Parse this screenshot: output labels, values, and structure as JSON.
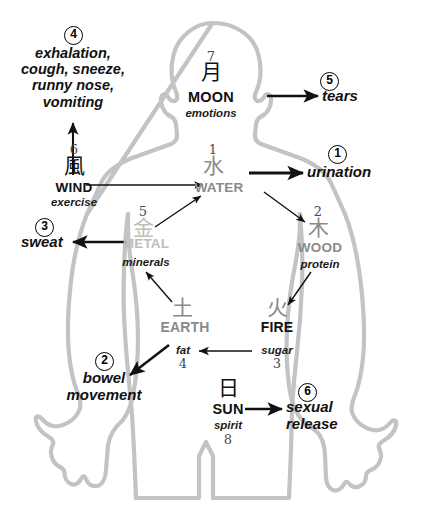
{
  "colors": {
    "body_outline": "#c3c3c3",
    "element_gray": "#8a8a8a",
    "metal_gray": "#bdbdbd",
    "arrow_black": "#111111",
    "text_black": "#111111",
    "number_gray": "#4a4a4a",
    "background": "#ffffff"
  },
  "elements": [
    {
      "key": "water",
      "number": "1",
      "kanji": "水",
      "name": "WATER",
      "subtitle": "",
      "color": "#8a8a8a"
    },
    {
      "key": "wood",
      "number": "2",
      "kanji": "木",
      "name": "WOOD",
      "subtitle": "protein",
      "color": "#8a8a8a"
    },
    {
      "key": "fire",
      "number": "3",
      "kanji": "火",
      "name": "FIRE",
      "subtitle": "sugar",
      "color": "#8a8a8a"
    },
    {
      "key": "earth",
      "number": "4",
      "kanji": "土",
      "name": "EARTH",
      "subtitle": "fat",
      "color": "#8a8a8a"
    },
    {
      "key": "metal",
      "number": "5",
      "kanji": "金",
      "name": "METAL",
      "subtitle": "minerals",
      "color": "#bdbdbd"
    },
    {
      "key": "wind",
      "number": "6",
      "kanji": "風",
      "name": "WIND",
      "subtitle": "exercise",
      "color": "#111111"
    },
    {
      "key": "moon",
      "number": "7",
      "kanji": "月",
      "name": "MOON",
      "subtitle": "emotions",
      "color": "#111111"
    },
    {
      "key": "sun",
      "number": "8",
      "kanji": "日",
      "name": "SUN",
      "subtitle": "spirit",
      "color": "#111111"
    }
  ],
  "outputs": [
    {
      "key": "urination",
      "marker": "1",
      "label": "urination"
    },
    {
      "key": "bowel_movement",
      "marker": "2",
      "label_line1": "bowel",
      "label_line2": "movement"
    },
    {
      "key": "sweat",
      "marker": "3",
      "label": "sweat"
    },
    {
      "key": "exhalation",
      "marker": "4",
      "label_line1": "exhalation,",
      "label_line2": "cough, sneeze,",
      "label_line3": "runny nose,",
      "label_line4": "vomiting"
    },
    {
      "key": "tears",
      "marker": "5",
      "label": "tears"
    },
    {
      "key": "sexual_release",
      "marker": "6",
      "label_line1": "sexual",
      "label_line2": "release"
    }
  ],
  "icons": {
    "body": "human-body-silhouette-icon"
  }
}
